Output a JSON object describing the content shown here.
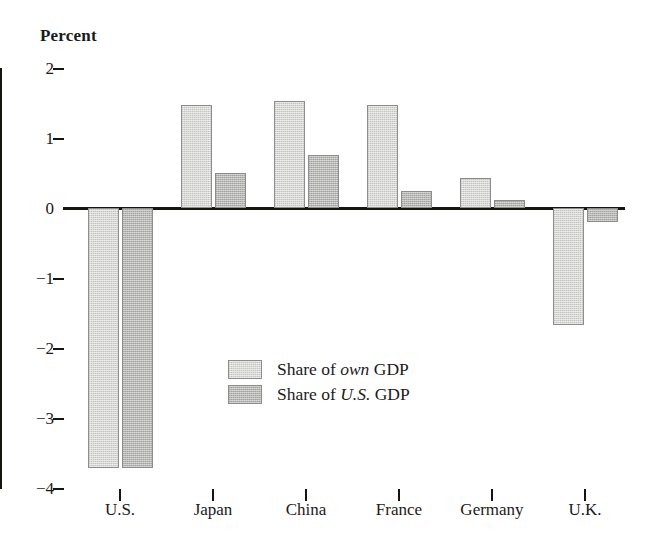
{
  "chart_data": {
    "type": "bar",
    "title": "",
    "ylabel": "Percent",
    "xlabel": "",
    "ylim": [
      -4,
      2
    ],
    "yticks": [
      2,
      1,
      0,
      -1,
      -2,
      -3,
      -4
    ],
    "ytick_labels": [
      "2",
      "1",
      "0",
      "−1",
      "−2",
      "−3",
      "−4"
    ],
    "grid": false,
    "legend_position": "center",
    "categories": [
      "U.S.",
      "Japan",
      "China",
      "France",
      "Germany",
      "U.K."
    ],
    "series": [
      {
        "name": "Share of own GDP",
        "name_prefix": "Share of ",
        "name_emphasis": "own",
        "name_suffix": " GDP",
        "color": "#d7d7d5",
        "values": [
          -3.72,
          1.47,
          1.53,
          1.47,
          0.43,
          -1.67
        ]
      },
      {
        "name": "Share of U.S. GDP",
        "name_prefix": "Share of ",
        "name_emphasis": "U.S.",
        "name_suffix": " GDP",
        "color": "#b6b6b4",
        "values": [
          -3.72,
          0.5,
          0.76,
          0.24,
          0.11,
          -0.2
        ]
      }
    ]
  },
  "axis": {
    "line_color": "#15150f"
  }
}
